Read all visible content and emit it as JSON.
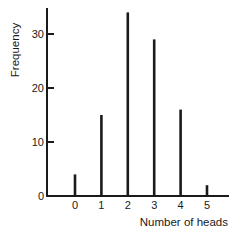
{
  "chart_data": {
    "type": "bar",
    "title": "",
    "xlabel": "Number of heads",
    "ylabel": "Frequency",
    "categories": [
      "0",
      "1",
      "2",
      "3",
      "4",
      "5"
    ],
    "values": [
      4,
      15,
      34,
      29,
      16,
      2
    ],
    "ylim": [
      0,
      35
    ],
    "yticks": [
      0,
      10,
      20,
      30
    ],
    "grid": false,
    "legend": null,
    "bar_style": "thin vertical lines (spike plot)",
    "colors": {
      "bars": "#1a1a1a",
      "axes": "#1a1a1a",
      "background": "#ffffff"
    }
  }
}
